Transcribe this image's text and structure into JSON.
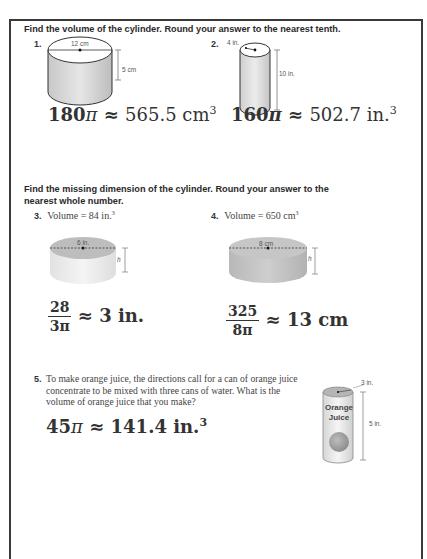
{
  "section1": {
    "instruction": "Find the volume of the cylinder. Round your answer to the nearest tenth.",
    "problems": [
      {
        "number": "1.",
        "diameter_label": "12 cm",
        "height_label": "5 cm",
        "answer_coef": "180",
        "answer_pi": "π",
        "answer_approx": "≈",
        "answer_value": "565.5 cm",
        "answer_exp": "3"
      },
      {
        "number": "2.",
        "radius_label": "4 in.",
        "height_label": "10 in.",
        "answer_coef": "160",
        "answer_pi": "π",
        "answer_approx": "≈",
        "answer_value": "502.7 in.",
        "answer_exp": "3"
      }
    ]
  },
  "section2": {
    "instruction_line1": "Find the missing dimension of the cylinder. Round your answer to the",
    "instruction_line2": "nearest whole number.",
    "problems": [
      {
        "number": "3.",
        "volume_text": "Volume = 84 in.",
        "volume_exp": "3",
        "diameter_label": "6 in.",
        "height_label": "h",
        "frac_num": "28",
        "frac_den": "3π",
        "answer_approx": "≈",
        "answer_value": "3 in."
      },
      {
        "number": "4.",
        "volume_text": "Volume = 650 cm",
        "volume_exp": "3",
        "diameter_label": "8 cm",
        "height_label": "h",
        "frac_num": "325",
        "frac_den": "8π",
        "answer_approx": "≈",
        "answer_value": "13 cm"
      }
    ]
  },
  "section3": {
    "number": "5.",
    "text_line1": "To make orange juice, the directions call for a can of orange juice",
    "text_line2": "concentrate to be mixed with three cans of water. What is the",
    "text_line3": "volume of orange juice that you make?",
    "can_label_line1": "Orange",
    "can_label_line2": "Juice",
    "diameter_label": "3 in.",
    "height_label": "5 in.",
    "answer_coef": "45",
    "answer_pi": "π",
    "answer_approx": "≈",
    "answer_value": "141.4 in.",
    "answer_exp": "3"
  }
}
